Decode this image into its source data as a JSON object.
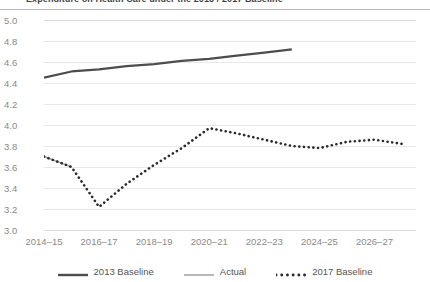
{
  "chart_data": {
    "type": "line",
    "title": "Expenditure on Health Care under the 2013 / 2017 Baseline",
    "xlabel": "",
    "ylabel": "",
    "ylim": [
      3.0,
      5.0
    ],
    "ytick_step": 0.2,
    "grid": true,
    "legend_position": "bottom",
    "x": [
      "2014-15",
      "2015-16",
      "2016-17",
      "2017-18",
      "2018-19",
      "2019-20",
      "2020-21",
      "2021-22",
      "2022-23",
      "2023-24",
      "2024-25",
      "2025-26",
      "2026-27",
      "2027-28"
    ],
    "xtick_labels": [
      "2014-15",
      "2016-17",
      "2018-19",
      "2020-21",
      "2022-23",
      "2024-25",
      "2026-27"
    ],
    "ytick_labels": [
      "5.0",
      "4.8",
      "4.6",
      "4.4",
      "4.2",
      "4.0",
      "3.8",
      "3.6",
      "3.4",
      "3.2",
      "3.0"
    ],
    "series": [
      {
        "name": "2013 Baseline",
        "style": "solid",
        "color": "#4d4d4d",
        "values": [
          4.45,
          4.51,
          4.53,
          4.56,
          4.58,
          4.61,
          4.63,
          4.66,
          4.69,
          4.72,
          null,
          null,
          null,
          null
        ]
      },
      {
        "name": "Actual",
        "style": "solid",
        "color": "#b0b0b0",
        "values": [
          3.7,
          3.6,
          null,
          null,
          null,
          null,
          null,
          null,
          null,
          null,
          null,
          null,
          null,
          null
        ]
      },
      {
        "name": "2017 Baseline",
        "style": "dotted",
        "color": "#2b2b2b",
        "values": [
          3.7,
          3.6,
          3.22,
          3.44,
          3.62,
          3.78,
          3.97,
          3.92,
          3.86,
          3.8,
          3.78,
          3.84,
          3.86,
          3.82
        ]
      }
    ]
  },
  "legend": {
    "items": [
      {
        "label": "2013 Baseline",
        "icon": "solid-line-swatch-dark"
      },
      {
        "label": "Actual",
        "icon": "solid-line-swatch-gray"
      },
      {
        "label": "2017 Baseline",
        "icon": "dotted-line-swatch-dark"
      }
    ]
  },
  "colors": {
    "baseline_2013": "#4d4d4d",
    "actual": "#b0b0b0",
    "baseline_2017": "#2b2b2b",
    "grid": "#e8e8e8",
    "axis_text": "#8a8a8a",
    "title_text": "#3f3f3f"
  }
}
